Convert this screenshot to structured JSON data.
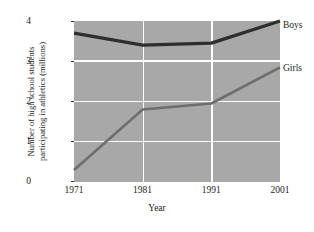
{
  "chart_data": {
    "type": "line",
    "title": "",
    "xlabel": "Year",
    "ylabel": "Number of high school students participating in athletics (millions)",
    "ylabel_lines": [
      "Number of high school students",
      "participating in athletics (millions)"
    ],
    "x": [
      1971,
      1981,
      1991,
      2001
    ],
    "xtick_labels": [
      "1971",
      "1981",
      "1991",
      "2001"
    ],
    "ytick_labels": [
      "0",
      "1",
      "2",
      "3",
      "4"
    ],
    "ytick_values": [
      0,
      1,
      2,
      3,
      4
    ],
    "xlim": [
      1971,
      2001
    ],
    "ylim": [
      0,
      4
    ],
    "grid": true,
    "grid_color": "#fdfdfd",
    "plot_background": "#a8a8a8",
    "legend_position": "right-direct-labels",
    "series": [
      {
        "name": "Boys",
        "color": "#2e2e2e",
        "values": [
          3.7,
          3.4,
          3.45,
          4.0
        ]
      },
      {
        "name": "Girls",
        "color": "#6e6e6e",
        "values": [
          0.3,
          1.8,
          1.95,
          2.85
        ]
      }
    ]
  },
  "axes": {
    "ytick_0": "0",
    "ytick_1": "1",
    "ytick_2": "2",
    "ytick_3": "3",
    "ytick_4": "4",
    "xtick_0": "1971",
    "xtick_1": "1981",
    "xtick_2": "1991",
    "xtick_3": "2001",
    "xlabel": "Year",
    "ylabel_line1": "Number of high school students",
    "ylabel_line2": "participating in athletics (millions)"
  },
  "labels": {
    "boys": "Boys",
    "girls": "Girls"
  }
}
